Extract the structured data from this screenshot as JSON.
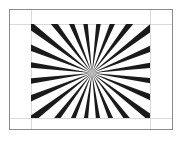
{
  "figure": {
    "background_color": "#ffffff",
    "frame": {
      "name": "outer-frame",
      "x": 9.5,
      "y": 9.5,
      "width": 163,
      "height": 120,
      "stroke_color": "#8a8a8a",
      "stroke_width": 1
    },
    "guides": {
      "stroke_color": "#d9d9d9",
      "stroke_width": 1,
      "vertical_x": [
        31.5,
        150.5
      ],
      "horizontal_y": [
        24.5,
        118.5
      ]
    },
    "clip_rect": {
      "name": "ray-clip-rect",
      "x": 31,
      "y": 24,
      "width": 119,
      "height": 94
    },
    "rays": {
      "count": 24,
      "center_x": 92,
      "center_y": 73,
      "start_angle_deg": 7.5,
      "angle_step_deg": 15,
      "color": "#1a1a1a",
      "tip_half_width_deg": 2.6,
      "length": 180
    }
  },
  "labels": {
    "domain": "Diagram"
  }
}
